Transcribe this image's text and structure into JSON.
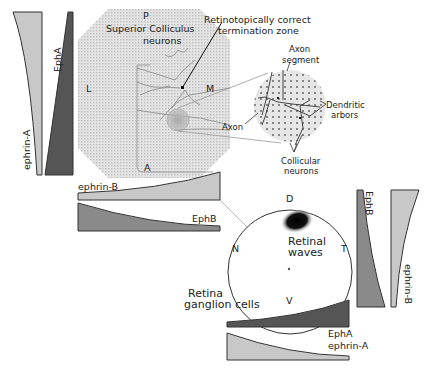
{
  "figure": {
    "colors": {
      "light_gradient": "#c8c8c8",
      "medium_gradient": "#8a8a8a",
      "dark_gradient": "#555555",
      "outline": "#333333",
      "sc_fill": "#d9d9d9",
      "background": "#ffffff"
    }
  },
  "superior_colliculus": {
    "label_line1": "Superior Colliculus",
    "label_line2": "neurons",
    "axis_labels": {
      "posterior": "P",
      "anterior": "A",
      "lateral": "L",
      "medial": "M"
    },
    "termination_zone_label_line1": "Retinotopically correct",
    "termination_zone_label_line2": "termination zone"
  },
  "zoom_inset": {
    "labels": {
      "axon_segment_line1": "Axon",
      "axon_segment_line2": "segment",
      "dendritic_line1": "Dendritic",
      "dendritic_line2": "arbors",
      "axon": "Axon",
      "collicular_line1": "Collicular",
      "collicular_line2": "neurons"
    }
  },
  "retina": {
    "axis_labels": {
      "dorsal": "D",
      "ventral": "V",
      "nasal": "N",
      "temporal": "T"
    },
    "waves_line1": "Retinal",
    "waves_line2": "waves",
    "ganglion_line1": "Retina",
    "ganglion_line2": "ganglion cells"
  },
  "gradients": {
    "sc_left_ephrinA": "ephrin-A",
    "sc_left_EphA": "EphA",
    "sc_bottom_ephrinB": "ephrin-B",
    "sc_bottom_EphB": "EphB",
    "retina_right_EphB": "EphB",
    "retina_right_ephrinB": "ephrin-B",
    "retina_bottom_EphA": "EphA",
    "retina_bottom_ephrinA": "ephrin-A"
  }
}
